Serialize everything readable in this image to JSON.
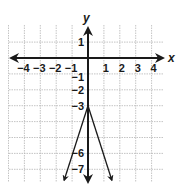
{
  "chart_data": {
    "type": "line",
    "title": "",
    "xlabel": "x",
    "ylabel": "y",
    "xlim": [
      -5,
      5
    ],
    "ylim": [
      -7.8,
      2
    ],
    "grid": true,
    "x_ticks": [
      -4,
      -3,
      -2,
      -1,
      1,
      2,
      3,
      4
    ],
    "x_tick_labels": [
      "−4",
      "−3",
      "−2",
      "−1",
      "1",
      "2",
      "3",
      "4"
    ],
    "y_ticks": [
      1,
      -1,
      -2,
      -3,
      -6,
      -7
    ],
    "y_tick_labels": [
      "1",
      "−1",
      "−2",
      "−3",
      "−6",
      "−7"
    ],
    "series": [
      {
        "name": "y = -3|x| - 3",
        "shape": "absolute-value (inverted V)",
        "vertex": [
          0,
          -3
        ],
        "points": [
          [
            -1.5,
            -7.5
          ],
          [
            0,
            -3
          ],
          [
            1.5,
            -7.5
          ]
        ],
        "color": "#1a1a1a"
      }
    ]
  },
  "labels": {
    "x_axis": "x",
    "y_axis": "y"
  },
  "colors": {
    "grid": "#b0b0b0",
    "axis": "#1a1a1a",
    "background": "#ffffff"
  }
}
